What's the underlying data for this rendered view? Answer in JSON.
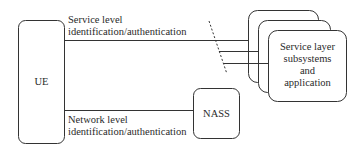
{
  "diagram": {
    "nodes": {
      "ue": {
        "label": "UE"
      },
      "nass": {
        "label": "NASS"
      },
      "service_layer": {
        "line1": "Service layer",
        "line2": "subsystems",
        "line3": "and",
        "line4": "application"
      }
    },
    "edges": {
      "service_level": {
        "line1": "Service level",
        "line2": "identification/authentication"
      },
      "network_level": {
        "line1": "Network level",
        "line2": "identification/authentication"
      }
    },
    "colors": {
      "stroke": "#333333",
      "text": "#2a2a2a",
      "background": "#ffffff"
    }
  }
}
